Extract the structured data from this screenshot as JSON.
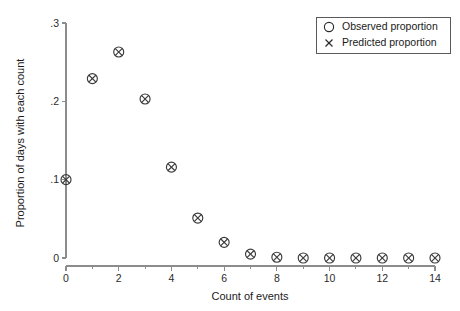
{
  "chart_data": {
    "type": "scatter",
    "title": "",
    "xlabel": "Count of events",
    "ylabel": "Proportion of days with each count",
    "xlim": [
      0,
      14
    ],
    "ylim": [
      0,
      0.3
    ],
    "grid": false,
    "legend_position": "top-right",
    "x_ticks": [
      {
        "value": 0,
        "label": "0"
      },
      {
        "value": 1,
        "label": ""
      },
      {
        "value": 2,
        "label": "2"
      },
      {
        "value": 3,
        "label": ""
      },
      {
        "value": 4,
        "label": "4"
      },
      {
        "value": 5,
        "label": ""
      },
      {
        "value": 6,
        "label": "6"
      },
      {
        "value": 7,
        "label": ""
      },
      {
        "value": 8,
        "label": "8"
      },
      {
        "value": 9,
        "label": ""
      },
      {
        "value": 10,
        "label": "10"
      },
      {
        "value": 11,
        "label": ""
      },
      {
        "value": 12,
        "label": "12"
      },
      {
        "value": 13,
        "label": ""
      },
      {
        "value": 14,
        "label": "14"
      }
    ],
    "y_ticks": [
      {
        "value": 0,
        "label": "0"
      },
      {
        "value": 0.1,
        "label": ".1"
      },
      {
        "value": 0.2,
        "label": ".2"
      },
      {
        "value": 0.3,
        "label": ".3"
      }
    ],
    "x": [
      0,
      1,
      2,
      3,
      4,
      5,
      6,
      7,
      8,
      9,
      10,
      11,
      12,
      13,
      14
    ],
    "series": [
      {
        "name": "Observed proportion",
        "marker": "circle",
        "values": [
          0.1,
          0.229,
          0.263,
          0.203,
          0.116,
          0.051,
          0.02,
          0.005,
          0.001,
          0.0,
          0.0,
          0.0,
          0.0,
          0.0,
          0.0
        ]
      },
      {
        "name": "Predicted proportion",
        "marker": "cross",
        "values": [
          0.1,
          0.229,
          0.263,
          0.203,
          0.116,
          0.051,
          0.02,
          0.005,
          0.001,
          0.0,
          0.0,
          0.0,
          0.0,
          0.0,
          0.0
        ]
      }
    ]
  },
  "legend": {
    "entries": [
      {
        "symbol": "circle-marker",
        "label": "Observed proportion"
      },
      {
        "symbol": "cross-marker",
        "label": "Predicted proportion"
      }
    ]
  },
  "colors": {
    "marker": "#3a3a3a",
    "axis": "#8c8c8c",
    "text": "#1a1a1a",
    "background": "#ffffff"
  }
}
